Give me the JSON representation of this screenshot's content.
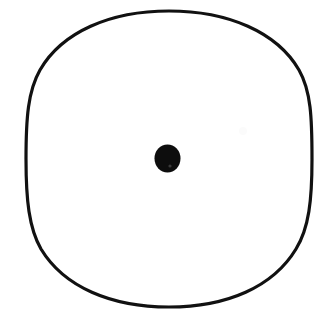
{
  "canvas": {
    "width": 331,
    "height": 323,
    "background_color": "#ffffff",
    "title": "Circle with center point"
  },
  "figure": {
    "type": "line-art-diagram",
    "description": "A single large hand-drawn black circle outline with a small solid black filled dot marking its center",
    "ink_color": "#111111",
    "elements": [
      {
        "name": "outer-circle",
        "shape": "ellipse",
        "center_x": 169,
        "center_y": 159,
        "radius_x": 143,
        "radius_y": 148,
        "stroke_color": "#111111",
        "stroke_width": 3.2,
        "fill": "none"
      },
      {
        "name": "center-dot",
        "shape": "ellipse",
        "center_x": 167.5,
        "center_y": 158.5,
        "radius_x": 13,
        "radius_y": 14,
        "fill_color": "#0d0d0d",
        "stroke": "none"
      }
    ],
    "bounds": {
      "left": 26,
      "right": 312,
      "top": 11,
      "bottom": 307
    }
  },
  "annotations": {
    "labels": [],
    "axes": [],
    "legend": []
  }
}
